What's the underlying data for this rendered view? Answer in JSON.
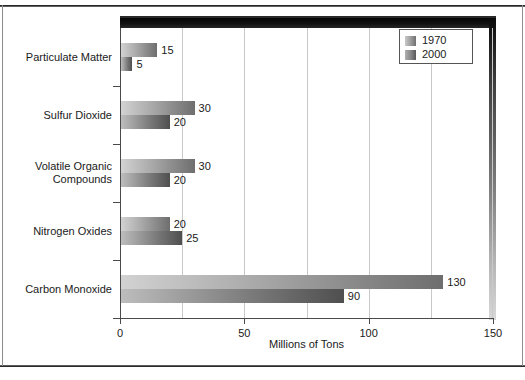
{
  "chart_data": {
    "type": "bar",
    "orientation": "horizontal",
    "title": "",
    "xlabel": "Millions of Tons",
    "ylabel": "",
    "xlim": [
      0,
      150
    ],
    "xticks": [
      0,
      50,
      100,
      150
    ],
    "xticklabels": [
      "0",
      "50",
      "100",
      "150"
    ],
    "gridlines": [
      25,
      50,
      75,
      100,
      125
    ],
    "grid": true,
    "categories": [
      "Particulate Matter",
      "Sulfur Dioxide",
      "Volatile Organic\nCompounds",
      "Nitrogen Oxides",
      "Carbon Monoxide"
    ],
    "series": [
      {
        "name": "1970",
        "values": [
          15,
          30,
          30,
          20,
          130
        ],
        "color": "#8c8c8c"
      },
      {
        "name": "2000",
        "values": [
          5,
          20,
          20,
          25,
          90
        ],
        "color": "#737373"
      }
    ],
    "value_labels": {
      "1970": [
        "15",
        "30",
        "30",
        "20",
        "130"
      ],
      "2000": [
        "5",
        "20",
        "20",
        "25",
        "90"
      ]
    },
    "legend": {
      "position": "top-right",
      "entries": [
        "1970",
        "2000"
      ]
    }
  },
  "axis": {
    "x_title": "Millions of Tons"
  }
}
